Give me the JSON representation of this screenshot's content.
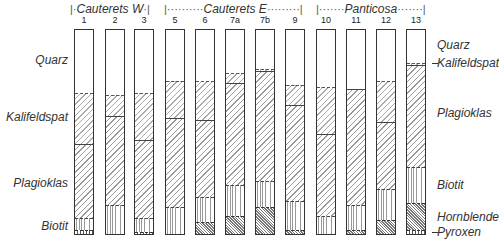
{
  "chart_data": {
    "type": "bar",
    "stacked": true,
    "orientation": "vertical",
    "title": "",
    "xlabel": "",
    "ylabel": "",
    "ylim": [
      0,
      100
    ],
    "unit": "%",
    "groups": [
      {
        "name": "Cauterets W",
        "samples": [
          "1",
          "2",
          "3"
        ]
      },
      {
        "name": "Cauterets E",
        "samples": [
          "5",
          "6",
          "7a",
          "7b",
          "9"
        ]
      },
      {
        "name": "Panticosa",
        "samples": [
          "10",
          "11",
          "12",
          "13"
        ]
      }
    ],
    "categories": [
      "1",
      "2",
      "3",
      "5",
      "6",
      "7a",
      "7b",
      "9",
      "10",
      "11",
      "12",
      "13"
    ],
    "series": [
      {
        "name": "Quarz",
        "values": [
          31,
          32,
          31,
          25,
          25,
          21,
          19,
          27,
          28,
          29,
          25,
          16
        ]
      },
      {
        "name": "Kalifeldspat",
        "values": [
          25,
          10,
          23,
          18,
          19,
          5,
          1,
          10,
          23,
          0,
          20,
          1
        ]
      },
      {
        "name": "Plagioklas",
        "values": [
          36,
          44,
          38,
          44,
          38,
          50,
          54,
          47,
          40,
          57,
          33,
          50
        ]
      },
      {
        "name": "Biotit",
        "values": [
          6,
          14,
          7,
          13,
          12,
          15,
          13,
          14,
          9,
          12,
          15,
          18
        ]
      },
      {
        "name": "Hornblende",
        "values": [
          0,
          0,
          0,
          0,
          6,
          9,
          13,
          2,
          0,
          2,
          7,
          13
        ]
      },
      {
        "name": "Pyroxen",
        "values": [
          2,
          0,
          1,
          0,
          0,
          0,
          0,
          0,
          0,
          0,
          0,
          2
        ]
      }
    ],
    "legend": {
      "left": [
        "Quarz",
        "Kalifeldspat",
        "Plagioklas",
        "Biotit"
      ],
      "right": [
        "Quarz",
        "Kalifeldspat",
        "Plagioklas",
        "Biotit",
        "Hornblende",
        "Pyroxen"
      ]
    },
    "grid": false
  },
  "labels": {
    "group1": "Cauterets W",
    "group2": "Cauterets E",
    "group3": "Panticosa",
    "left": {
      "quarz": "Quarz",
      "kalifeldspat": "Kalifeldspat",
      "plagioklas": "Plagioklas",
      "biotit": "Biotit"
    },
    "right": {
      "quarz": "Quarz",
      "kalifeldspat": "Kalifeldspat",
      "plagioklas": "Plagioklas",
      "biotit": "Biotit",
      "hornblende": "Hornblende",
      "pyroxen": "Pyroxen"
    }
  }
}
